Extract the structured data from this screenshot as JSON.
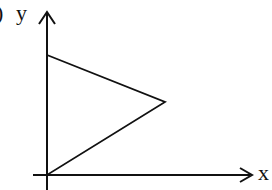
{
  "figure": {
    "label_fragment": ")",
    "y_axis_label": "y",
    "x_axis_label": "x",
    "stroke_color": "#111111",
    "background": "#ffffff"
  },
  "shape": {
    "type": "triangle",
    "vertices": [
      {
        "name": "origin",
        "x": 47,
        "y": 175
      },
      {
        "name": "top-on-y-axis",
        "x": 47,
        "y": 55
      },
      {
        "name": "right-vertex",
        "x": 165,
        "y": 102
      }
    ]
  },
  "axes": {
    "origin": {
      "x": 47,
      "y": 175
    },
    "x_axis": {
      "from": 33,
      "to": 252
    },
    "y_axis": {
      "from": 190,
      "to": 12
    }
  }
}
